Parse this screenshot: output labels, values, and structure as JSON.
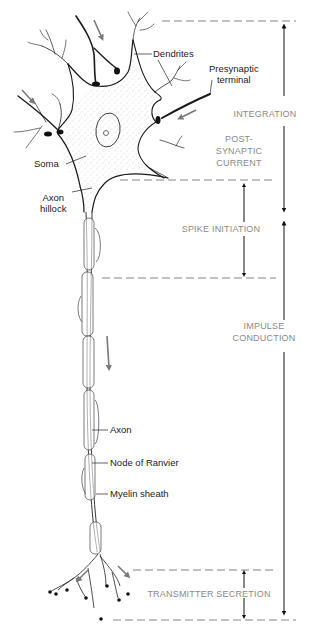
{
  "figure": {
    "structure_labels": {
      "dendrites": "Dendrites",
      "presynaptic_terminal_line1": "Presynaptic",
      "presynaptic_terminal_line2": "terminal",
      "soma": "Soma",
      "axon_hillock_line1": "Axon",
      "axon_hillock_line2": "hillock",
      "axon": "Axon",
      "node_of_ranvier": "Node of Ranvier",
      "myelin_sheath": "Myelin sheath"
    },
    "functional_regions": {
      "integration": "INTEGRATION",
      "post_synaptic_line1": "POST-",
      "post_synaptic_line2": "SYNAPTIC",
      "post_synaptic_line3": "CURRENT",
      "spike_initiation": "SPIKE  INITIATION",
      "impulse_conduction_line1": "IMPULSE",
      "impulse_conduction_line2": "CONDUCTION",
      "transmitter_secretion": "TRANSMITTER SECRETION"
    },
    "colors": {
      "ink": "#1a1a1a",
      "region_text": "#8a8a8a",
      "flow_arrow": "#7a7a7a",
      "dashed_guide": "#777777",
      "soma_stipple": "#b5b5b5"
    }
  }
}
